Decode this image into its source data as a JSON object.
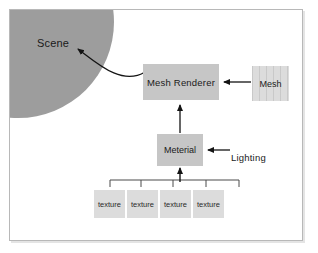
{
  "diagram": {
    "title_region": {
      "scene_label": "Scene"
    },
    "nodes": {
      "mesh_renderer": {
        "label": "Mesh  Renderer"
      },
      "mesh": {
        "label": "Mesh"
      },
      "material": {
        "label": "Meterial"
      },
      "lighting": {
        "label": "Lighting"
      }
    },
    "textures": [
      {
        "label": "texture"
      },
      {
        "label": "texture"
      },
      {
        "label": "texture"
      },
      {
        "label": "texture"
      }
    ],
    "colors": {
      "scene_circle": "#9d9d9d",
      "box_fill_dark": "#c6c6c6",
      "box_fill_light": "#dcdcdc",
      "arrow": "#141414",
      "frame_border": "#b8b8b8",
      "page_background": "#ffffff"
    }
  }
}
